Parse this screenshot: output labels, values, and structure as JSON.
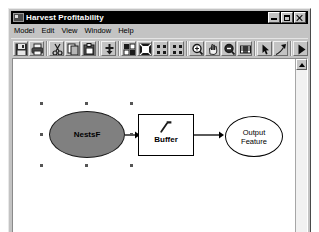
{
  "window": {
    "title": "Harvest Profitability",
    "icon": "model-document-icon",
    "controls": [
      {
        "name": "minimize-button",
        "label": "Minimize",
        "glyph": "_"
      },
      {
        "name": "maximize-button",
        "label": "Maximize",
        "glyph": "□"
      },
      {
        "name": "close-button",
        "label": "Close",
        "glyph": "×"
      }
    ]
  },
  "menubar": {
    "items": [
      {
        "label": "Model",
        "name": "menu-model"
      },
      {
        "label": "Edit",
        "name": "menu-edit"
      },
      {
        "label": "View",
        "name": "menu-view"
      },
      {
        "label": "Window",
        "name": "menu-window"
      },
      {
        "label": "Help",
        "name": "menu-help"
      }
    ]
  },
  "toolbar": {
    "buttons": [
      {
        "name": "save-button",
        "icon": "save-floppy-icon",
        "tooltip": "Save"
      },
      {
        "name": "print-button",
        "icon": "printer-icon",
        "tooltip": "Print"
      },
      {
        "sep": true
      },
      {
        "name": "cut-button",
        "icon": "scissors-icon",
        "tooltip": "Cut"
      },
      {
        "name": "copy-button",
        "icon": "copy-pages-icon",
        "tooltip": "Copy"
      },
      {
        "name": "paste-button",
        "icon": "paste-clipboard-icon",
        "tooltip": "Paste"
      },
      {
        "sep": true
      },
      {
        "name": "add-data-button",
        "icon": "add-data-plus-icon",
        "tooltip": "Add Data"
      },
      {
        "sep": true
      },
      {
        "name": "auto-layout-button",
        "icon": "auto-layout-icon",
        "tooltip": "Auto Layout"
      },
      {
        "name": "validate-button",
        "icon": "validate-entire-model-icon",
        "tooltip": "Validate Entire Model"
      },
      {
        "name": "diagram-properties-button",
        "icon": "diagram-grid-icon",
        "tooltip": "Diagram Properties"
      },
      {
        "name": "model-report-button",
        "icon": "model-report-grid-icon",
        "tooltip": "Model Report"
      },
      {
        "sep": true
      },
      {
        "name": "zoom-in-button",
        "icon": "magnifier-plus-icon",
        "tooltip": "Zoom In"
      },
      {
        "name": "pan-button",
        "icon": "pan-hand-icon",
        "tooltip": "Pan"
      },
      {
        "name": "zoom-out-button",
        "icon": "magnifier-minus-icon",
        "tooltip": "Zoom Out"
      },
      {
        "name": "full-extent-button",
        "icon": "full-extent-icon",
        "tooltip": "Full Extent"
      },
      {
        "sep": true
      },
      {
        "name": "select-tool-button",
        "icon": "select-arrow-icon",
        "tooltip": "Select"
      },
      {
        "name": "connect-tool-button",
        "icon": "connect-arrow-icon",
        "tooltip": "Connect"
      },
      {
        "sep": true
      },
      {
        "name": "run-button",
        "icon": "run-play-icon",
        "tooltip": "Run"
      }
    ]
  },
  "canvas": {
    "nodes": [
      {
        "name": "input-data-variable",
        "type": "data-variable",
        "shape": "ellipse",
        "label": "NestsF",
        "fill": "#808080",
        "selected": true,
        "x": 36,
        "y": 52,
        "w": 76,
        "h": 47
      },
      {
        "name": "buffer-tool",
        "type": "tool",
        "shape": "rectangle",
        "label": "Buffer",
        "icon": "hammer-tool-icon",
        "fill": "#ffffff",
        "selected": false,
        "x": 125,
        "y": 55,
        "w": 56,
        "h": 42
      },
      {
        "name": "output-data-variable",
        "type": "derived-data-variable",
        "shape": "ellipse",
        "label_line1": "Output",
        "label_line2": "Feature",
        "fill": "#ffffff",
        "selected": false,
        "x": 212,
        "y": 57,
        "w": 58,
        "h": 41
      }
    ],
    "connectors": [
      {
        "name": "connector-input-to-buffer",
        "from": "input-data-variable",
        "to": "buffer-tool"
      },
      {
        "name": "connector-buffer-to-output",
        "from": "buffer-tool",
        "to": "output-data-variable"
      }
    ]
  },
  "scrollbar": {
    "name": "vertical-scrollbar",
    "up_arrow": "scroll-up-arrow-icon"
  }
}
